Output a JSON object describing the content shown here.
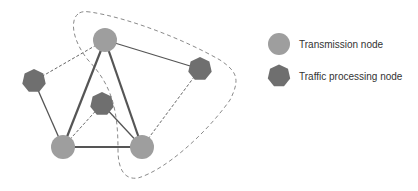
{
  "colors": {
    "transmission_node": "#9e9e9e",
    "traffic_node": "#6f6f6f",
    "solid_edge": "#555555",
    "dashed_edge": "#666666",
    "boundary": "#8a8a8a",
    "text": "#333333"
  },
  "nodes": [
    {
      "id": "T1",
      "type": "transmission",
      "x": 105,
      "y": 40
    },
    {
      "id": "T2",
      "type": "transmission",
      "x": 63,
      "y": 147
    },
    {
      "id": "T3",
      "type": "transmission",
      "x": 142,
      "y": 147
    },
    {
      "id": "P1",
      "type": "traffic",
      "x": 34,
      "y": 81
    },
    {
      "id": "P2",
      "type": "traffic",
      "x": 102,
      "y": 104
    },
    {
      "id": "P3",
      "type": "traffic",
      "x": 200,
      "y": 69
    }
  ],
  "edges": [
    {
      "from": "T1",
      "to": "T2",
      "style": "solid-thick"
    },
    {
      "from": "T1",
      "to": "T3",
      "style": "solid-thick"
    },
    {
      "from": "T2",
      "to": "T3",
      "style": "solid-thick"
    },
    {
      "from": "T1",
      "to": "P3",
      "style": "solid"
    },
    {
      "from": "P1",
      "to": "T2",
      "style": "solid"
    },
    {
      "from": "P2",
      "to": "T3",
      "style": "solid"
    },
    {
      "from": "T1",
      "to": "P1",
      "style": "dashed"
    },
    {
      "from": "T2",
      "to": "P2",
      "style": "dashed"
    },
    {
      "from": "T3",
      "to": "P3",
      "style": "dashed"
    }
  ],
  "legend": {
    "items": [
      {
        "symbol": "circle",
        "label": "Transmission node"
      },
      {
        "symbol": "heptagon",
        "label": "Traffic processing node"
      }
    ]
  }
}
